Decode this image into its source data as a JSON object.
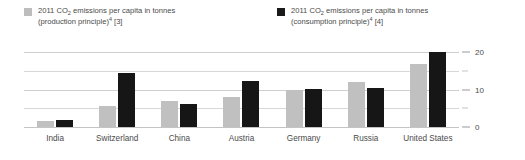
{
  "chart_data": {
    "type": "bar",
    "title": "",
    "subtitle": "",
    "xlabel": "",
    "ylabel": "",
    "ylim": [
      0,
      22
    ],
    "yticks": [
      0,
      10,
      20
    ],
    "yticks_minor": [
      5,
      15
    ],
    "ytick_labels": [
      "0",
      "10",
      "20"
    ],
    "grid": true,
    "legend_position": "top",
    "categories": [
      "India",
      "Switzerland",
      "China",
      "Austria",
      "Germany",
      "Russia",
      "United States"
    ],
    "series": [
      {
        "name": "2011 CO2 emissions per capita in tonnes (production principle)4 [3]",
        "color": "#c0c0c0",
        "values": [
          1.6,
          5.6,
          7.0,
          8.1,
          10.0,
          12.2,
          17.0
        ]
      },
      {
        "name": "2011 CO2 emissions per capita in tonnes (consumption principle)4 [4]",
        "color": "#161616",
        "values": [
          1.9,
          14.5,
          6.1,
          12.4,
          10.3,
          10.5,
          20.0
        ]
      }
    ]
  },
  "legend": {
    "entries": [
      {
        "swatch_color": "#bdbdbd",
        "line1_pre": "2011 CO",
        "line1_sub": "2",
        "line1_post": " emissions per capita in tonnes",
        "line2_pre": "(production principle)",
        "line2_sup": "4",
        "line2_post": " [3]"
      },
      {
        "swatch_color": "#1a1a1a",
        "line1_pre": "2011 CO",
        "line1_sub": "2",
        "line1_post": " emissions per capita in tonnes",
        "line2_pre": "(consumption principle)",
        "line2_sup": "4",
        "line2_post": " [4]"
      }
    ]
  },
  "axis": {
    "y_tick_labels": [
      "20",
      "10",
      "0"
    ],
    "x_tick_labels": [
      "India",
      "Switzerland",
      "China",
      "Austria",
      "Germany",
      "Russia",
      "United States"
    ]
  }
}
